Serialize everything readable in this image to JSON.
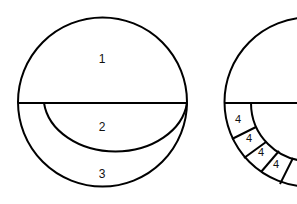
{
  "diagram": {
    "left_figure": {
      "description": "Circle divided by horizontal diameter; lower half contains inner crescent arc",
      "regions": [
        {
          "id": "region-1",
          "label": "1"
        },
        {
          "id": "region-2",
          "label": "2"
        },
        {
          "id": "region-3",
          "label": "3"
        }
      ]
    },
    "right_figure": {
      "description": "Circle (cropped) with horizontal diameter; lower ring segmented into cells",
      "cells": [
        {
          "label": "4"
        },
        {
          "label": "4"
        },
        {
          "label": "4"
        },
        {
          "label": "4"
        }
      ]
    },
    "colors": {
      "stroke": "#000000",
      "background": "#ffffff"
    }
  }
}
